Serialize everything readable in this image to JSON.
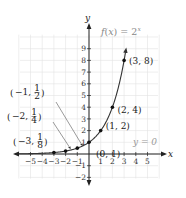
{
  "chart_data": {
    "type": "line",
    "title": "",
    "function_label": "f(x) = 2^x",
    "function_label_parts": {
      "f": "f",
      "lparen": "(",
      "var": "x",
      "rparen": ")",
      "eq": " = 2",
      "exp": "x"
    },
    "xlabel": "x",
    "ylabel": "y",
    "xlim": [
      -6,
      6
    ],
    "ylim": [
      -2.5,
      10
    ],
    "grid": true,
    "x_ticks": [
      -5,
      -4,
      -3,
      -2,
      -1,
      1,
      2,
      3,
      4,
      5
    ],
    "y_ticks": [
      -2,
      -1,
      1,
      2,
      3,
      4,
      5,
      6,
      7,
      8,
      9
    ],
    "x_tick_labels": [
      "−5",
      "−4",
      "−3",
      "−2",
      "−1",
      "1",
      "2",
      "3",
      "4",
      "5"
    ],
    "y_tick_labels": [
      "−2",
      "−1",
      "1",
      "2",
      "3",
      "4",
      "5",
      "6",
      "7",
      "8",
      "9"
    ],
    "series": [
      {
        "name": "f(x) = 2^x",
        "x": [
          -3,
          -2,
          -1,
          0,
          1,
          2,
          3
        ],
        "y": [
          0.125,
          0.25,
          0.5,
          1,
          2,
          4,
          8
        ]
      }
    ],
    "points": [
      {
        "x": -3,
        "y": 0.125,
        "label_num": "−3,",
        "frac_n": "1",
        "frac_d": "8"
      },
      {
        "x": -2,
        "y": 0.25,
        "label_num": "−2,",
        "frac_n": "1",
        "frac_d": "4"
      },
      {
        "x": -1,
        "y": 0.5,
        "label_num": "−1,",
        "frac_n": "1",
        "frac_d": "2"
      },
      {
        "x": 0,
        "y": 1,
        "label": "(0, 1)"
      },
      {
        "x": 1,
        "y": 2,
        "label": "(1, 2)"
      },
      {
        "x": 2,
        "y": 4,
        "label": "(2, 4)"
      },
      {
        "x": 3,
        "y": 8,
        "label": "(3, 8)"
      }
    ],
    "asymptote_label": "y = 0"
  }
}
